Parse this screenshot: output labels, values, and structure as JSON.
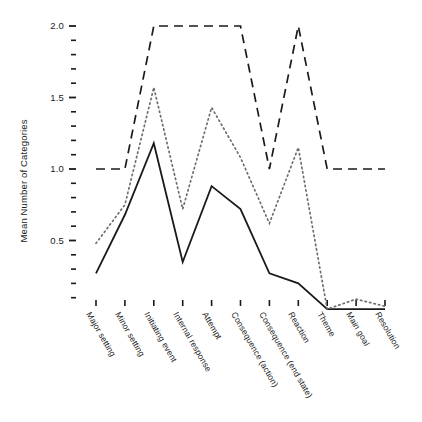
{
  "figure": {
    "top_cut_text": "",
    "background": "#ffffff"
  },
  "axes": {
    "ylabel": "Mean Number of Categories",
    "xlabel": "",
    "ytick_labels": [
      "2.0",
      "1.5",
      "1.0",
      "0.5"
    ],
    "ytick_values": [
      2.0,
      1.5,
      1.0,
      0.5
    ],
    "ylim": [
      -0.05,
      2.05
    ],
    "minor_tick_step": 0.1,
    "grid": false,
    "legend": "none",
    "line_color": "#1a1a1a"
  },
  "chart_data": {
    "type": "line",
    "title": "",
    "xlabel": "",
    "ylabel": "Mean Number of Categories",
    "ylim": [
      -0.05,
      2.05
    ],
    "grid": false,
    "legend_position": "none",
    "categories": [
      "Major setting",
      "Minor setting",
      "Initiating event",
      "Internal response",
      "Attempt",
      "Consequence (action)",
      "Consequence (end state)",
      "Reaction",
      "Theme",
      "Main goal",
      "Resolution"
    ],
    "series": [
      {
        "name": "solid",
        "style": "solid",
        "color": "#1a1a1a",
        "values": [
          0.27,
          0.68,
          1.18,
          0.35,
          0.88,
          0.72,
          0.27,
          0.2,
          0.02,
          0.02,
          0.02
        ]
      },
      {
        "name": "dotted",
        "style": "dotted",
        "color": "#6e6e6e",
        "values": [
          0.48,
          0.75,
          1.57,
          0.72,
          1.43,
          1.08,
          0.62,
          1.15,
          0.02,
          0.09,
          0.04
        ]
      },
      {
        "name": "dashed",
        "style": "dashed",
        "color": "#1a1a1a",
        "values": [
          1.0,
          1.0,
          2.0,
          2.0,
          2.0,
          2.0,
          1.0,
          2.0,
          1.0,
          1.0,
          1.0
        ]
      }
    ]
  }
}
